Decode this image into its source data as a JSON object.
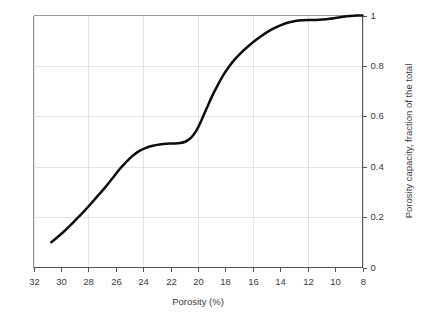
{
  "chart_data": {
    "type": "line",
    "title": "",
    "subtitle": "",
    "xlabel": "Porosity (%)",
    "ylabel": "Porosity capacity, fraction of the total",
    "xlim": [
      32,
      8
    ],
    "ylim": [
      0,
      1
    ],
    "x_axis_reversed": true,
    "y_axis_side": "right",
    "grid": true,
    "grid_color": "#d8d8d8",
    "legend": false,
    "legend_position": "none",
    "xticks": [
      32,
      30,
      28,
      26,
      24,
      22,
      20,
      18,
      16,
      14,
      12,
      10,
      8
    ],
    "xtick_labels": [
      "32",
      "30",
      "28",
      "26",
      "24",
      "22",
      "20",
      "18",
      "16",
      "14",
      "12",
      "10",
      "8"
    ],
    "xgridlines": [
      32,
      28,
      24,
      20,
      16,
      12,
      8
    ],
    "yticks": [
      0,
      0.2,
      0.4,
      0.6,
      0.8,
      1
    ],
    "ytick_labels": [
      "0",
      "0.2",
      "0.4",
      "0.6",
      "0.8",
      "1"
    ],
    "ygridlines": [
      0.2,
      0.4,
      0.6,
      0.8
    ],
    "series": [
      {
        "name": "Cumulative porosity capacity",
        "color": "#0d0d0d",
        "line_width": 2.5,
        "x": [
          30.7,
          30.3,
          29.8,
          29.3,
          28.8,
          28.3,
          27.8,
          27.3,
          26.8,
          26.3,
          25.8,
          25.3,
          24.8,
          24.3,
          23.8,
          23.3,
          22.8,
          22.3,
          21.8,
          21.3,
          20.9,
          20.5,
          20.1,
          19.7,
          19.3,
          18.9,
          18.5,
          18.1,
          17.7,
          17.3,
          16.9,
          16.4,
          15.9,
          15.4,
          14.9,
          14.4,
          13.9,
          13.4,
          12.9,
          12.4,
          11.9,
          11.4,
          10.9,
          10.4,
          9.9,
          9.4,
          8.9,
          8.4,
          8.0
        ],
        "y": [
          0.1,
          0.118,
          0.142,
          0.168,
          0.196,
          0.224,
          0.254,
          0.285,
          0.316,
          0.35,
          0.385,
          0.415,
          0.442,
          0.462,
          0.475,
          0.483,
          0.488,
          0.491,
          0.492,
          0.494,
          0.5,
          0.515,
          0.545,
          0.59,
          0.64,
          0.688,
          0.73,
          0.768,
          0.8,
          0.827,
          0.85,
          0.875,
          0.898,
          0.918,
          0.936,
          0.951,
          0.963,
          0.972,
          0.978,
          0.981,
          0.982,
          0.982,
          0.984,
          0.987,
          0.991,
          0.995,
          0.998,
          1.0,
          1.0
        ]
      }
    ],
    "annotations": [
      {
        "text": "plateau near 0.49 between 24% and 21% porosity"
      },
      {
        "text": "steep rise between 21% and 17% porosity"
      },
      {
        "text": "curve saturates at 1.0 below 13% porosity"
      }
    ]
  },
  "axes": {
    "x_title": "Porosity (%)",
    "y_title": "Porosity capacity, fraction of the total"
  }
}
